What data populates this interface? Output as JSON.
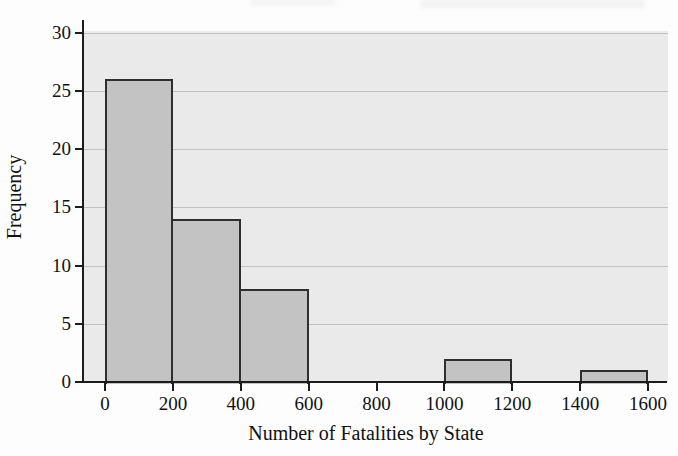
{
  "chart_data": {
    "type": "bar",
    "subtype": "histogram",
    "title": "",
    "xlabel": "Number of Fatalities by State",
    "ylabel": "Frequency",
    "bin_width": 200,
    "bin_edges": [
      0,
      200,
      400,
      600,
      800,
      1000,
      1200,
      1400,
      1600
    ],
    "frequencies": [
      26,
      14,
      8,
      0,
      0,
      2,
      0,
      1
    ],
    "x_ticks": [
      0,
      200,
      400,
      600,
      800,
      1000,
      1200,
      1400,
      1600
    ],
    "y_ticks": [
      0,
      5,
      10,
      15,
      20,
      25,
      30
    ],
    "xlim": [
      0,
      1600
    ],
    "ylim": [
      0,
      30
    ],
    "grid": "horizontal-only",
    "legend": "none",
    "colors": {
      "bar_fill": "#c3c3c3",
      "bar_border": "#2e2e2e",
      "plot_background": "#eaeaea",
      "gridline": "#a0a0a0",
      "axis": "#1c1c1c",
      "text": "#111111",
      "page_background": "#fdfdfd"
    }
  }
}
